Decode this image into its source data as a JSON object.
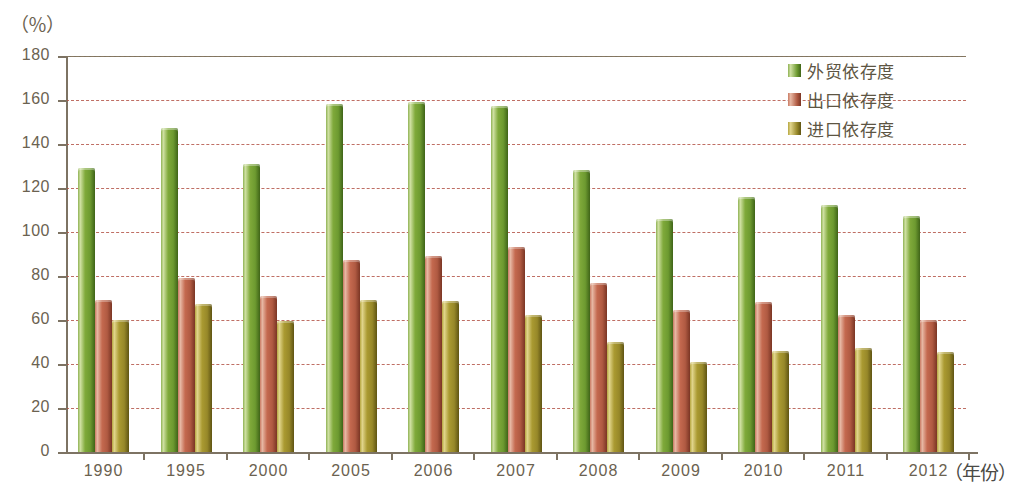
{
  "unit_label": "（％）",
  "xaxis_title": "（年份）",
  "legend": [
    {
      "label": "外贸依存度",
      "color": "#7aa83c"
    },
    {
      "label": "出口依存度",
      "color": "#c0684f"
    },
    {
      "label": "进口依存度",
      "color": "#a89a35"
    }
  ],
  "y_ticks": [
    "0",
    "20",
    "40",
    "60",
    "80",
    "100",
    "120",
    "140",
    "160",
    "180"
  ],
  "chart_data": {
    "type": "bar",
    "title": "",
    "xlabel": "（年份）",
    "ylabel": "（％）",
    "ylim": [
      0,
      180
    ],
    "y_tick_step": 20,
    "grid": true,
    "legend_position": "top-right",
    "categories": [
      "1990",
      "1995",
      "2000",
      "2005",
      "2006",
      "2007",
      "2008",
      "2009",
      "2010",
      "2011",
      "2012"
    ],
    "series": [
      {
        "name": "外贸依存度",
        "color": "#7aa83c",
        "values": [
          129,
          147.5,
          131,
          158,
          159,
          157.5,
          128,
          106,
          116,
          112.5,
          107.5
        ]
      },
      {
        "name": "出口依存度",
        "color": "#c0684f",
        "values": [
          69,
          79,
          71,
          87.5,
          89,
          93,
          77,
          64.5,
          68,
          62.5,
          60
        ]
      },
      {
        "name": "进口依存度",
        "color": "#a89a35",
        "values": [
          60,
          67.5,
          59.5,
          69,
          68.5,
          62.5,
          50,
          41,
          46,
          47.5,
          45.5
        ]
      }
    ]
  }
}
